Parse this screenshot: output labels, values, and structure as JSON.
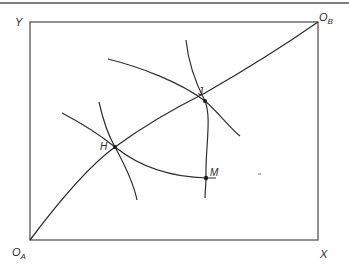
{
  "diagram": {
    "type": "edgeworth-box-contract-curve",
    "axes": {
      "origin_a": {
        "main": "O",
        "sub": "A"
      },
      "origin_b": {
        "main": "O",
        "sub": "B"
      },
      "y_label": "Y",
      "x_label": "X"
    },
    "points": [
      {
        "id": "H",
        "label": "H"
      },
      {
        "id": "J",
        "label": "J"
      },
      {
        "id": "M",
        "label": "M"
      }
    ],
    "colors": {
      "line": "#2f2f2f",
      "frame": "#555555",
      "text": "#2a2a2a"
    }
  }
}
